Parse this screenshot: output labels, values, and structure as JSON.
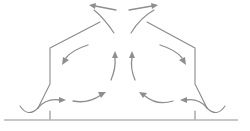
{
  "diagram": {
    "title": "",
    "colors": {
      "outline": "#8a8a8a",
      "ground": "#b5b5b5",
      "arrow": "#8e8e8e",
      "background": "#ffffff"
    },
    "labels": [],
    "arrows": [
      {
        "id": "left-inflow",
        "direction": "right"
      },
      {
        "id": "left-lower-rising",
        "direction": "up-right"
      },
      {
        "id": "left-center-up",
        "direction": "up"
      },
      {
        "id": "left-top-out",
        "direction": "up-left"
      },
      {
        "id": "left-recirc-down",
        "direction": "down-left"
      },
      {
        "id": "right-inflow",
        "direction": "left"
      },
      {
        "id": "right-lower-rising",
        "direction": "up-left"
      },
      {
        "id": "right-center-up",
        "direction": "up"
      },
      {
        "id": "right-top-out",
        "direction": "up-right"
      },
      {
        "id": "right-recirc-down",
        "direction": "down-right"
      }
    ]
  }
}
